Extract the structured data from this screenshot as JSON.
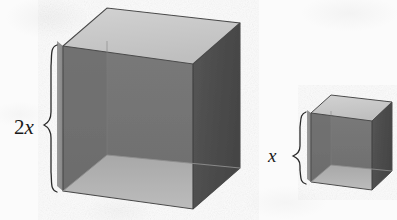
{
  "figure": {
    "type": "geometry-diagram",
    "background_color": "#fbfbfb",
    "ink_color": "#1a1a1a"
  },
  "labels": {
    "large_cube_height": "2x",
    "small_cube_height": "x"
  },
  "shapes": {
    "large_cube": {
      "name": "large-cube",
      "edge_label": "2x",
      "relative_edge": 2,
      "colors": {
        "top_face": "#c9c9c9",
        "right_face": "#4e4e4e",
        "left_outer_face": "#8c8c8c",
        "interior_back": "#757575",
        "interior_left": "#6a6a6a",
        "interior_floor": "#b0b0b0",
        "edge_line": "#5a5a5a"
      },
      "geometry": {
        "front_bottom_left": [
          63,
          191
        ],
        "front_bottom_right": [
          193,
          209
        ],
        "front_top_left": [
          63,
          46
        ],
        "front_top_right": [
          193,
          64
        ],
        "back_top_left": [
          107,
          8
        ],
        "back_top_right": [
          240,
          23
        ],
        "back_bottom_right": [
          240,
          168
        ],
        "interior_floor_front_y": 191,
        "interior_horizon_y": 141
      }
    },
    "small_cube": {
      "name": "small-cube",
      "edge_label": "x",
      "relative_edge": 1,
      "colors": {
        "top_face": "#c9c9c9",
        "right_face": "#4e4e4e",
        "left_outer_face": "#8c8c8c",
        "interior_back": "#757575",
        "interior_left": "#6a6a6a",
        "interior_floor": "#b0b0b0",
        "edge_line": "#5a5a5a"
      },
      "geometry": {
        "front_bottom_left": [
          311,
          182
        ],
        "front_bottom_right": [
          372,
          190
        ],
        "front_top_left": [
          311,
          113
        ],
        "front_top_right": [
          372,
          121
        ],
        "back_top_left": [
          331,
          95
        ],
        "back_top_right": [
          392,
          102
        ],
        "back_bottom_right": [
          392,
          171
        ],
        "interior_floor_front_y": 182,
        "interior_horizon_y": 158
      }
    }
  },
  "braces": {
    "large": {
      "name": "brace-large",
      "label": "2x",
      "top_y": 45,
      "bottom_y": 192,
      "x": 56,
      "tip_x": 44,
      "label_position": [
        14,
        127
      ]
    },
    "small": {
      "name": "brace-small",
      "label": "x",
      "top_y": 112,
      "bottom_y": 183,
      "x": 304,
      "tip_x": 293,
      "label_position": [
        268,
        155
      ]
    }
  }
}
